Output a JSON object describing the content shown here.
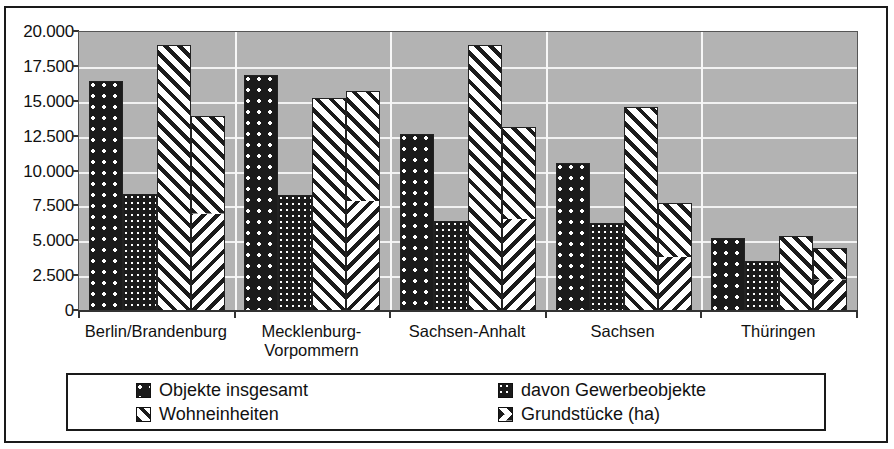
{
  "chart_data": {
    "type": "bar",
    "title": "",
    "subtitle": "",
    "xlabel": "",
    "ylabel": "",
    "ylim": [
      0,
      20000
    ],
    "ytick_labels": [
      "20.000",
      "17.500",
      "15.000",
      "12.500",
      "10.000",
      "7.500",
      "5.000",
      "2.500",
      "0"
    ],
    "ytick_values": [
      20000,
      17500,
      15000,
      12500,
      10000,
      7500,
      5000,
      2500,
      0
    ],
    "grid": true,
    "legend_position": "bottom",
    "categories": [
      "Berlin/Brandenburg",
      "Mecklenburg-\nVorpommern",
      "Sachsen-Anhalt",
      "Sachsen",
      "Thüringen"
    ],
    "series": [
      {
        "name": "Objekte insgesamt",
        "pattern": "dots-sparse",
        "values": [
          16500,
          16950,
          12700,
          10600,
          5200
        ]
      },
      {
        "name": "davon Gewerbeobjekte",
        "pattern": "dots-dense",
        "values": [
          8400,
          8350,
          6450,
          6300,
          3550
        ]
      },
      {
        "name": "Wohneinheiten",
        "pattern": "diagonal-stripes",
        "values": [
          19050,
          15300,
          19100,
          14650,
          5400
        ]
      },
      {
        "name": "Grundstücke (ha)",
        "pattern": "chevron",
        "values": [
          13950,
          15800,
          13200,
          7750,
          4550
        ]
      }
    ]
  },
  "legend": {
    "entries": [
      {
        "label": "Objekte insgesamt",
        "pattern": "dots-sparse"
      },
      {
        "label": "davon Gewerbeobjekte",
        "pattern": "dots-dense"
      },
      {
        "label": "Wohneinheiten",
        "pattern": "diagonal-stripes"
      },
      {
        "label": "Grundstücke (ha)",
        "pattern": "chevron"
      }
    ]
  },
  "colors": {
    "plot_background": "#b3b3b3",
    "gridline": "#f2f2f2",
    "bar_dark": "#1b1b1b",
    "bar_light": "#ffffff",
    "axis": "#333333",
    "frame": "#1a1a1a",
    "page_background": "#ffffff"
  }
}
